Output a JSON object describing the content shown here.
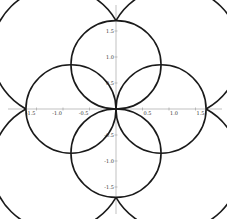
{
  "chart_data": {
    "type": "line",
    "title": "",
    "xlabel": "",
    "ylabel": "",
    "xlim": [
      -1.85,
      2.05
    ],
    "ylim": [
      -2.1,
      2.1
    ],
    "grid": false,
    "legend": null,
    "x_ticks": [
      -1.5,
      -1.0,
      -0.5,
      0.5,
      1.0,
      1.5
    ],
    "x_tick_labels": [
      "-1.5",
      "-1.0",
      "-0.5",
      "0.5",
      "1.0",
      "1.5"
    ],
    "y_ticks": [
      1.5,
      1.0,
      0.5,
      -0.5,
      -1.0,
      -1.5
    ],
    "y_tick_labels": [
      "1.5",
      "1.0",
      "0.5",
      "-0.5",
      "-1.0",
      "-1.5"
    ],
    "shapes": {
      "outer_arcs": [
        {
          "cx": -0.63,
          "cy": 0.63,
          "r": 1.25,
          "from": [
            0,
            1.7
          ],
          "to": [
            -1.7,
            0
          ]
        },
        {
          "cx": 0.63,
          "cy": 0.63,
          "r": 1.25,
          "from": [
            1.7,
            0
          ],
          "to": [
            0,
            1.7
          ]
        },
        {
          "cx": -0.63,
          "cy": -0.63,
          "r": 1.25,
          "from": [
            -1.7,
            0
          ],
          "to": [
            0,
            -1.7
          ]
        },
        {
          "cx": 0.63,
          "cy": -0.63,
          "r": 1.25,
          "from": [
            0,
            -1.7
          ],
          "to": [
            1.7,
            0
          ]
        }
      ],
      "inner_loops": [
        {
          "cx": 0,
          "cy": 0.85,
          "r": 0.85
        },
        {
          "cx": 0,
          "cy": -0.85,
          "r": 0.85
        },
        {
          "cx": -0.85,
          "cy": 0,
          "r": 0.85
        },
        {
          "cx": 0.85,
          "cy": 0,
          "r": 0.85
        }
      ],
      "axis_crossings": [
        [
          1.7,
          0
        ],
        [
          -1.7,
          0
        ],
        [
          0,
          1.7
        ],
        [
          0,
          -1.7
        ],
        [
          0,
          0
        ]
      ]
    },
    "curve_color": "#1a1a1a",
    "axis_color": "#999999"
  }
}
